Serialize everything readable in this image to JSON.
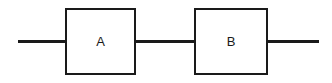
{
  "diagram": {
    "type": "block-diagram",
    "blocks": [
      {
        "id": "A",
        "label": "A"
      },
      {
        "id": "B",
        "label": "B"
      }
    ],
    "connections": [
      {
        "from": "input",
        "to": "A"
      },
      {
        "from": "A",
        "to": "B"
      },
      {
        "from": "B",
        "to": "output"
      }
    ],
    "colors": {
      "stroke": "#1a1a1a",
      "fill": "#ffffff"
    }
  }
}
